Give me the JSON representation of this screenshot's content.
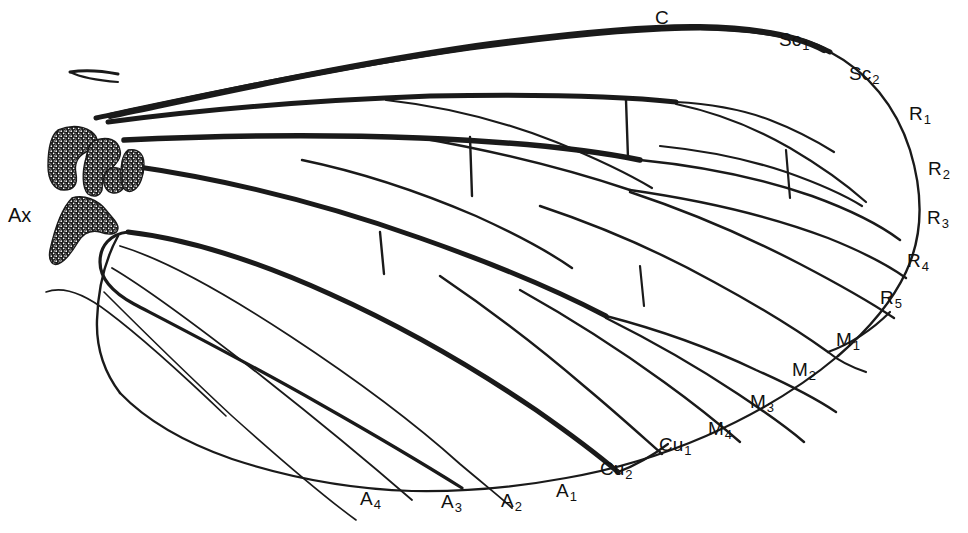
{
  "figure": {
    "background_color": "#ffffff",
    "ink_color": "#1a1a1a",
    "width": 968,
    "height": 533
  },
  "labels": [
    {
      "id": "costa",
      "base": "C",
      "sub": "",
      "x": 655,
      "y": 8,
      "vein": "Costa"
    },
    {
      "id": "subcosta-1",
      "base": "Sc",
      "sub": "1",
      "x": 779,
      "y": 30,
      "vein": "Subcosta 1"
    },
    {
      "id": "subcosta-2",
      "base": "Sc",
      "sub": "2",
      "x": 849,
      "y": 64,
      "vein": "Subcosta 2"
    },
    {
      "id": "radius-1",
      "base": "R",
      "sub": "1",
      "x": 909,
      "y": 104,
      "vein": "Radius 1"
    },
    {
      "id": "radius-2",
      "base": "R",
      "sub": "2",
      "x": 928,
      "y": 159,
      "vein": "Radius 2"
    },
    {
      "id": "radius-3",
      "base": "R",
      "sub": "3",
      "x": 927,
      "y": 208,
      "vein": "Radius 3"
    },
    {
      "id": "radius-4",
      "base": "R",
      "sub": "4",
      "x": 907,
      "y": 251,
      "vein": "Radius 4"
    },
    {
      "id": "radius-5",
      "base": "R",
      "sub": "5",
      "x": 880,
      "y": 288,
      "vein": "Radius 5"
    },
    {
      "id": "media-1",
      "base": "M",
      "sub": "1",
      "x": 836,
      "y": 330,
      "vein": "Media 1"
    },
    {
      "id": "media-2",
      "base": "M",
      "sub": "2",
      "x": 792,
      "y": 360,
      "vein": "Media 2"
    },
    {
      "id": "media-3",
      "base": "M",
      "sub": "3",
      "x": 750,
      "y": 392,
      "vein": "Media 3"
    },
    {
      "id": "media-4",
      "base": "M",
      "sub": "4",
      "x": 708,
      "y": 419,
      "vein": "Media 4"
    },
    {
      "id": "cubitus-1",
      "base": "Cu",
      "sub": "1",
      "x": 659,
      "y": 435,
      "vein": "Cubitus 1"
    },
    {
      "id": "cubitus-2",
      "base": "Cu",
      "sub": "2",
      "x": 600,
      "y": 459,
      "vein": "Cubitus 2"
    },
    {
      "id": "anal-1",
      "base": "A",
      "sub": "1",
      "x": 556,
      "y": 481,
      "vein": "Anal 1"
    },
    {
      "id": "anal-2",
      "base": "A",
      "sub": "2",
      "x": 501,
      "y": 491,
      "vein": "Anal 2"
    },
    {
      "id": "anal-3",
      "base": "A",
      "sub": "3",
      "x": 441,
      "y": 492,
      "vein": "Anal 3"
    },
    {
      "id": "anal-4",
      "base": "A",
      "sub": "4",
      "x": 360,
      "y": 489,
      "vein": "Anal 4"
    },
    {
      "id": "axillary",
      "base": "Ax",
      "sub": "",
      "x": 8,
      "y": 205,
      "vein": "Axillary sclerites"
    }
  ],
  "structures": {
    "axillary_sclerites": "stippled dark sclerite plates at wing base",
    "cross_veins": "short connecting veins between longitudinal veins",
    "wing_margin": "continuous outline from base around apex to anal angle"
  }
}
